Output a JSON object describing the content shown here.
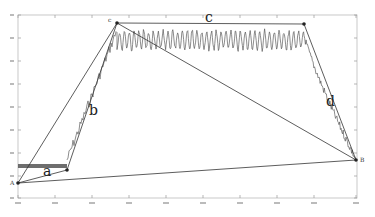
{
  "chart_data": {
    "type": "line",
    "title": "",
    "xlabel": "",
    "ylabel": "",
    "grid": false,
    "legend": null,
    "plot_area_px": {
      "left": 18,
      "right": 357,
      "top": 15,
      "bottom": 198
    },
    "x_ticks_px": [
      18,
      55,
      92,
      129,
      166,
      203,
      240,
      277,
      314,
      356
    ],
    "y_ticks_px": [
      15,
      38,
      61,
      84,
      107,
      130,
      153,
      176,
      198
    ],
    "key_points": [
      {
        "name": "A",
        "x_px": 18,
        "y_px": 183
      },
      {
        "name": "a_end",
        "x_px": 67,
        "y_px": 170
      },
      {
        "name": "C",
        "x_px": 117,
        "y_px": 23
      },
      {
        "name": "c_end",
        "x_px": 304,
        "y_px": 24
      },
      {
        "name": "B",
        "x_px": 356,
        "y_px": 160
      }
    ],
    "segments": [
      {
        "label": "a",
        "from": "A",
        "to": "a_end"
      },
      {
        "label": "b",
        "from": "a_end",
        "to": "C"
      },
      {
        "label": "c",
        "from": "C",
        "to": "c_end"
      },
      {
        "label": "d",
        "from": "c_end",
        "to": "B"
      },
      {
        "label": "",
        "from": "A",
        "to": "B"
      },
      {
        "label": "",
        "from": "A",
        "to": "C"
      },
      {
        "label": "",
        "from": "C",
        "to": "B"
      }
    ],
    "series": [
      {
        "name": "noisy signal",
        "phases": [
          {
            "phase": "flat-start",
            "x_px": [
              18,
              67
            ],
            "y_px_band": [
              164,
              168
            ]
          },
          {
            "phase": "rise",
            "x_px": [
              67,
              117
            ],
            "y_px": [
              160,
              30
            ]
          },
          {
            "phase": "plateau-oscillation",
            "x_px": [
              117,
              304
            ],
            "y_px_band": [
              28,
              52
            ]
          },
          {
            "phase": "fall",
            "x_px": [
              304,
              356
            ],
            "y_px": [
              35,
              160
            ]
          }
        ]
      }
    ]
  },
  "labels": {
    "A": "A",
    "B": "B",
    "C_point": "c",
    "a": "a",
    "b": "b",
    "c": "c",
    "d": "d"
  }
}
